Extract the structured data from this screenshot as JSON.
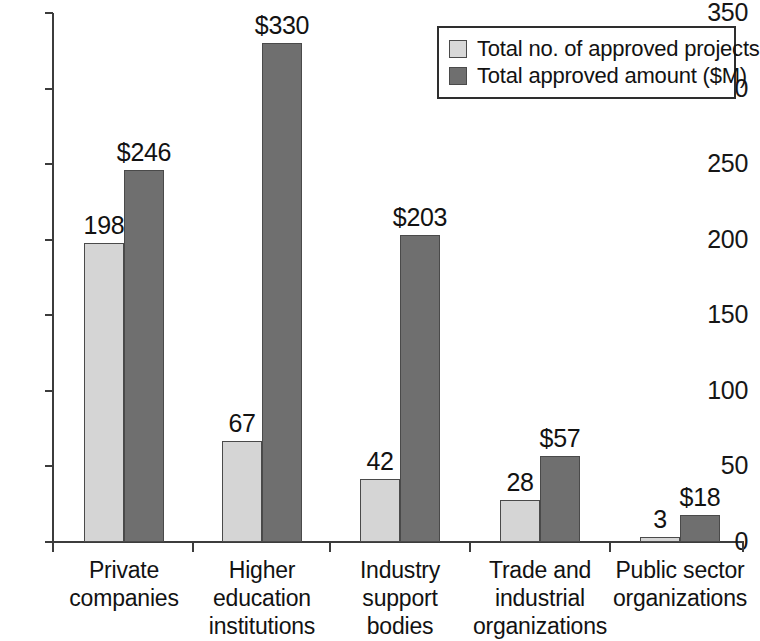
{
  "chart_data": {
    "type": "bar",
    "title": "",
    "subtitle": "",
    "xlabel": "",
    "ylabel": "",
    "ylim": [
      0,
      350
    ],
    "ytick_interval": 50,
    "yticks": [
      0,
      50,
      100,
      150,
      200,
      250,
      300,
      350
    ],
    "ytick_labels": [
      "0",
      "50",
      "100",
      "150",
      "200",
      "250",
      "300",
      "350"
    ],
    "grid": false,
    "legend_position": "top-right",
    "categories": [
      "Private\ncompanies",
      "Higher\neducation\ninstitutions",
      "Industry\nsupport\nbodies",
      "Trade and\nindustrial\norganizations",
      "Public sector\norganizations"
    ],
    "category_lines": [
      [
        "Private",
        "companies"
      ],
      [
        "Higher",
        "education",
        "institutions"
      ],
      [
        "Industry",
        "support",
        "bodies"
      ],
      [
        "Trade and",
        "industrial",
        "organizations"
      ],
      [
        "Public sector",
        "organizations"
      ]
    ],
    "series": [
      {
        "name": "Total no. of approved projects",
        "color": "#d5d5d5",
        "values": [
          198,
          67,
          42,
          28,
          3
        ],
        "data_labels": [
          "198",
          "67",
          "42",
          "28",
          "3"
        ]
      },
      {
        "name": "Total approved amount ($M)",
        "color": "#6f6f6f",
        "values": [
          246,
          330,
          203,
          57,
          18
        ],
        "data_labels": [
          "$246",
          "$330",
          "$203",
          "$57",
          "$18"
        ]
      }
    ]
  },
  "legend": {
    "entries": [
      {
        "label": "Total no. of approved projects",
        "color": "#d5d5d5"
      },
      {
        "label": "Total approved amount ($M)",
        "color": "#6f6f6f"
      }
    ]
  },
  "colors": {
    "series_light": "#d5d5d5",
    "series_dark": "#6f6f6f",
    "axis": "#3c3c3c",
    "text": "#121212",
    "background": "#ffffff"
  }
}
